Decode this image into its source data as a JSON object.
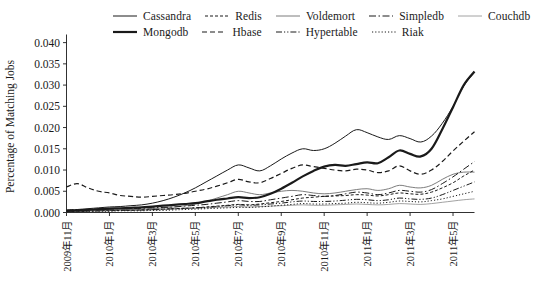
{
  "chart_data": {
    "type": "line",
    "title": "",
    "xlabel": "",
    "ylabel": "Percentage of Matching Jobs",
    "ylim": [
      0.0,
      0.0405
    ],
    "yticks": [
      0.0,
      0.005,
      0.01,
      0.015,
      0.02,
      0.025,
      0.03,
      0.035,
      0.04
    ],
    "ytick_labels": [
      "0.000",
      "0.005",
      "0.010",
      "0.015",
      "0.020",
      "0.025",
      "0.030",
      "0.035",
      "0.040"
    ],
    "grid": false,
    "legend_position": "above-plot",
    "x_tick_labels": [
      "2009年11月",
      "2010年1月",
      "2010年3月",
      "2010年5月",
      "2010年7月",
      "2010年9月",
      "2010年11月",
      "2011年1月",
      "2011年3月",
      "2011年5月"
    ],
    "x_tick_indices": [
      0,
      4,
      8,
      12,
      16,
      20,
      24,
      28,
      32,
      36
    ],
    "x_count": 39,
    "series": [
      {
        "name": "Cassandra",
        "style": "solid",
        "width": 1.0,
        "color": "#1a1a1a",
        "values": [
          0.0005,
          0.0007,
          0.0009,
          0.0011,
          0.0013,
          0.0014,
          0.0016,
          0.0018,
          0.0022,
          0.0028,
          0.0036,
          0.0046,
          0.0058,
          0.0072,
          0.0086,
          0.01,
          0.0112,
          0.0105,
          0.0098,
          0.011,
          0.0126,
          0.014,
          0.015,
          0.0146,
          0.015,
          0.0163,
          0.018,
          0.0195,
          0.0188,
          0.0178,
          0.0172,
          0.0181,
          0.0174,
          0.0166,
          0.018,
          0.021,
          0.025,
          0.0298,
          0.033
        ]
      },
      {
        "name": "Mongodb",
        "style": "solid",
        "width": 2.2,
        "color": "#1a1a1a",
        "values": [
          0.0004,
          0.0005,
          0.0006,
          0.0008,
          0.0009,
          0.001,
          0.0011,
          0.0012,
          0.0014,
          0.0016,
          0.0018,
          0.002,
          0.0022,
          0.0026,
          0.003,
          0.0033,
          0.0036,
          0.0034,
          0.0036,
          0.0044,
          0.0056,
          0.007,
          0.0085,
          0.0098,
          0.0108,
          0.0112,
          0.011,
          0.0114,
          0.0118,
          0.0116,
          0.013,
          0.0146,
          0.0138,
          0.0132,
          0.015,
          0.0196,
          0.0248,
          0.03,
          0.0332
        ]
      },
      {
        "name": "Redis",
        "style": "dotted-dash",
        "width": 1.0,
        "color": "#1a1a1a",
        "values": [
          0.0002,
          0.0003,
          0.0003,
          0.0004,
          0.0004,
          0.0005,
          0.0005,
          0.0006,
          0.0007,
          0.0008,
          0.0009,
          0.001,
          0.0011,
          0.0013,
          0.0015,
          0.0017,
          0.0019,
          0.0018,
          0.002,
          0.0023,
          0.0026,
          0.003,
          0.0034,
          0.0036,
          0.0038,
          0.0039,
          0.004,
          0.0042,
          0.0041,
          0.0039,
          0.0042,
          0.0046,
          0.0044,
          0.0043,
          0.0048,
          0.0058,
          0.007,
          0.0086,
          0.01
        ]
      },
      {
        "name": "Hbase",
        "style": "dashed",
        "width": 1.2,
        "color": "#1a1a1a",
        "values": [
          0.006,
          0.0068,
          0.0058,
          0.005,
          0.0046,
          0.004,
          0.0038,
          0.0036,
          0.0038,
          0.004,
          0.0042,
          0.0045,
          0.005,
          0.0055,
          0.0062,
          0.007,
          0.0078,
          0.0072,
          0.007,
          0.008,
          0.0092,
          0.0104,
          0.0112,
          0.0108,
          0.0104,
          0.01,
          0.0098,
          0.0102,
          0.01,
          0.0094,
          0.0098,
          0.011,
          0.0098,
          0.009,
          0.01,
          0.012,
          0.0145,
          0.0168,
          0.019
        ]
      },
      {
        "name": "Voldemort",
        "style": "solid",
        "width": 0.9,
        "color": "#6e6e6e",
        "values": [
          0.0003,
          0.0004,
          0.0005,
          0.0006,
          0.0006,
          0.0007,
          0.0007,
          0.0008,
          0.0009,
          0.0011,
          0.0013,
          0.0016,
          0.002,
          0.0026,
          0.0034,
          0.0042,
          0.005,
          0.0046,
          0.0042,
          0.0046,
          0.005,
          0.0052,
          0.005,
          0.0046,
          0.0044,
          0.0046,
          0.005,
          0.0054,
          0.0056,
          0.0052,
          0.0056,
          0.0064,
          0.006,
          0.0058,
          0.0064,
          0.0078,
          0.009,
          0.0095,
          0.0095
        ]
      },
      {
        "name": "Hypertable",
        "style": "dash-dot-dot",
        "width": 1.0,
        "color": "#1a1a1a",
        "values": [
          0.0003,
          0.0003,
          0.0004,
          0.0004,
          0.0005,
          0.0005,
          0.0006,
          0.0006,
          0.0007,
          0.0008,
          0.0009,
          0.001,
          0.0011,
          0.0012,
          0.0014,
          0.0016,
          0.0018,
          0.0017,
          0.0018,
          0.002,
          0.0022,
          0.0025,
          0.0027,
          0.0026,
          0.0026,
          0.0027,
          0.0029,
          0.0031,
          0.003,
          0.0028,
          0.003,
          0.0034,
          0.0032,
          0.0031,
          0.0034,
          0.0042,
          0.0052,
          0.0062,
          0.0072
        ]
      },
      {
        "name": "Simpledb",
        "style": "dash-dot",
        "width": 1.0,
        "color": "#1a1a1a",
        "values": [
          0.0006,
          0.0007,
          0.0007,
          0.0008,
          0.0008,
          0.0009,
          0.0009,
          0.001,
          0.0011,
          0.0012,
          0.0013,
          0.0015,
          0.0017,
          0.0019,
          0.0022,
          0.0025,
          0.0028,
          0.0026,
          0.0026,
          0.003,
          0.0034,
          0.0038,
          0.0042,
          0.004,
          0.0038,
          0.004,
          0.0044,
          0.0048,
          0.0046,
          0.0042,
          0.0046,
          0.0052,
          0.005,
          0.0048,
          0.0054,
          0.0068,
          0.0084,
          0.0102,
          0.012
        ]
      },
      {
        "name": "Riak",
        "style": "dotted",
        "width": 1.0,
        "color": "#1a1a1a",
        "values": [
          0.0002,
          0.0002,
          0.0003,
          0.0003,
          0.0003,
          0.0004,
          0.0004,
          0.0004,
          0.0005,
          0.0005,
          0.0006,
          0.0007,
          0.0008,
          0.0009,
          0.001,
          0.0011,
          0.0012,
          0.0012,
          0.0013,
          0.0015,
          0.0017,
          0.0019,
          0.0021,
          0.002,
          0.002,
          0.0021,
          0.0022,
          0.0024,
          0.0023,
          0.0022,
          0.0024,
          0.0027,
          0.0026,
          0.0025,
          0.0028,
          0.0032,
          0.0038,
          0.0044,
          0.005
        ]
      },
      {
        "name": "Couchdb",
        "style": "solid",
        "width": 0.8,
        "color": "#8a8a8a",
        "values": [
          0.0003,
          0.0003,
          0.0004,
          0.0004,
          0.0005,
          0.0005,
          0.0005,
          0.0006,
          0.0006,
          0.0007,
          0.0008,
          0.0009,
          0.001,
          0.0011,
          0.0012,
          0.0013,
          0.0014,
          0.0013,
          0.0014,
          0.0015,
          0.0016,
          0.0017,
          0.0018,
          0.0017,
          0.0017,
          0.0018,
          0.0019,
          0.002,
          0.0019,
          0.0018,
          0.0019,
          0.0021,
          0.002,
          0.0019,
          0.0021,
          0.0024,
          0.0027,
          0.003,
          0.0032
        ]
      }
    ]
  },
  "legend": {
    "rows": [
      [
        {
          "label": "Cassandra",
          "style": "solid",
          "width": 1.0,
          "color": "#1a1a1a"
        },
        {
          "label": "Redis",
          "style": "dotted-dash",
          "width": 1.0,
          "color": "#1a1a1a"
        },
        {
          "label": "Voldemort",
          "style": "solid",
          "width": 0.9,
          "color": "#6e6e6e"
        },
        {
          "label": "Simpledb",
          "style": "dash-dot",
          "width": 1.0,
          "color": "#1a1a1a"
        },
        {
          "label": "Couchdb",
          "style": "solid",
          "width": 0.8,
          "color": "#8a8a8a"
        }
      ],
      [
        {
          "label": "Mongodb",
          "style": "solid",
          "width": 2.2,
          "color": "#1a1a1a"
        },
        {
          "label": "Hbase",
          "style": "dashed",
          "width": 1.2,
          "color": "#1a1a1a"
        },
        {
          "label": "Hypertable",
          "style": "dash-dot-dot",
          "width": 1.0,
          "color": "#1a1a1a"
        },
        {
          "label": "Riak",
          "style": "dotted",
          "width": 1.0,
          "color": "#1a1a1a"
        }
      ]
    ]
  }
}
